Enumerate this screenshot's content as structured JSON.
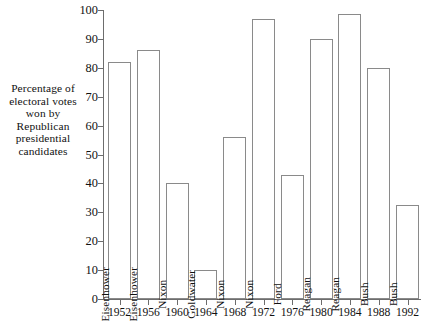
{
  "caption": {
    "lines": [
      "Percentage of",
      "electoral votes",
      "won by",
      "Republican",
      "presidential",
      "candidates"
    ],
    "text": "Percentage of electoral votes won by Republican presidential candidates"
  },
  "chart_data": {
    "type": "bar",
    "title": "",
    "xlabel": "",
    "ylabel": "Percentage of electoral votes won by Republican presidential candidates",
    "ylim": [
      0,
      100
    ],
    "yticks": [
      0,
      10,
      20,
      30,
      40,
      50,
      60,
      70,
      80,
      90,
      100
    ],
    "ytick_labels": [
      "0",
      "10",
      "20",
      "30",
      "40",
      "50",
      "60",
      "70",
      "80",
      "90",
      "100"
    ],
    "grid": false,
    "legend": "none",
    "categories": [
      "1952",
      "1956",
      "1960",
      "1964",
      "1968",
      "1972",
      "1976",
      "1980",
      "1984",
      "1988",
      "1992"
    ],
    "bar_labels": [
      "Eisenhower",
      "Eisenhower",
      "Nixon",
      "Goldwater",
      "Nixon",
      "Nixon",
      "Ford",
      "Reagan",
      "Reagan",
      "Bush",
      "Bush"
    ],
    "values": [
      82,
      86,
      40,
      10,
      56,
      97,
      43,
      90,
      98.5,
      80,
      32.5
    ],
    "bar_style": {
      "fill": "#ffffff",
      "edge": "#8a8a8a"
    },
    "axis_color": "#6d6d6d"
  }
}
